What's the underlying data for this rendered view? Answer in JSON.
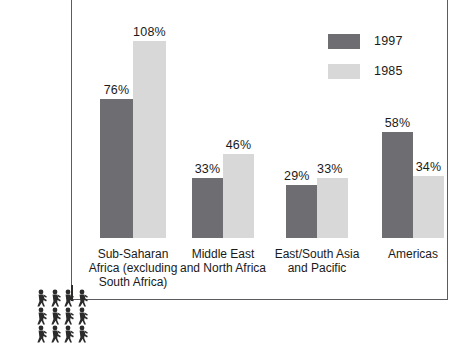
{
  "chart_data": {
    "type": "bar",
    "title": "",
    "subtitle": "",
    "xlabel": "",
    "ylabel": "",
    "grid": false,
    "legend_position": "top-right",
    "value_suffix": "%",
    "ylim": [
      0,
      115
    ],
    "categories": [
      "Sub-Saharan\nAfrica (excluding\nSouth Africa)",
      "Middle East\nand North Africa",
      "East/South Asia\nand Pacific",
      "Americas"
    ],
    "series": [
      {
        "name": "1997",
        "color": "#6e6e72",
        "values": [
          76,
          33,
          29,
          58
        ],
        "labels": [
          "76%",
          "33%",
          "29%",
          "58%"
        ]
      },
      {
        "name": "1985",
        "color": "#d8d8d8",
        "values": [
          108,
          46,
          33,
          34
        ],
        "labels": [
          "108%",
          "46%",
          "33%",
          "34%"
        ]
      }
    ]
  },
  "legend": {
    "items": [
      {
        "label": "1997",
        "color": "#6e6e72"
      },
      {
        "label": "1985",
        "color": "#d8d8d8"
      }
    ]
  },
  "decoration": {
    "pictogram_name": "people-pictogram",
    "pictogram_color": "#2b2b2b",
    "person_count": 12
  },
  "colors": {
    "series_1997": "#6e6e72",
    "series_1985": "#d8d8d8",
    "frame_border": "#5b5b63",
    "text": "#1a1a1a",
    "background": "#ffffff"
  }
}
